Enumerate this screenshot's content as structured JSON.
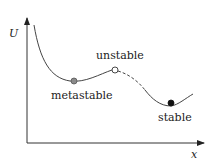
{
  "diagram": {
    "axes": {
      "y_label": "U",
      "x_label": "x"
    },
    "states": [
      {
        "label": "metastable",
        "ball": "gray",
        "color": "#8a8a8a"
      },
      {
        "label": "unstable",
        "ball": "hollow",
        "color": "#ffffff"
      },
      {
        "label": "stable",
        "ball": "black",
        "color": "#111111"
      }
    ]
  }
}
